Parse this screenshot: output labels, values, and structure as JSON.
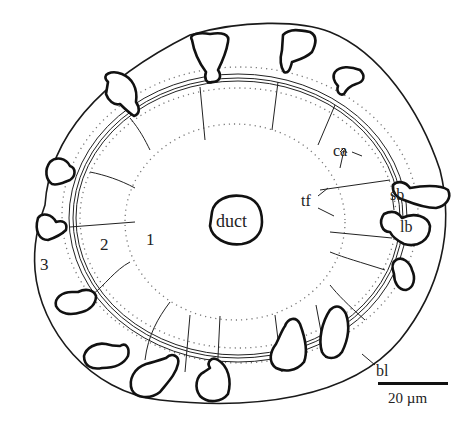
{
  "figure": {
    "labels": {
      "duct": "duct",
      "zone1": "1",
      "zone2": "2",
      "zone3": "3",
      "ca": "ca",
      "tf": "tf",
      "sb": "sb",
      "lb": "lb",
      "bl": "bl"
    },
    "scale_bar": {
      "label": "20 µm"
    }
  }
}
